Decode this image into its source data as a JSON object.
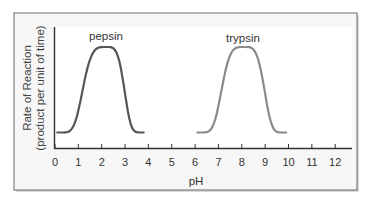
{
  "chart_data": {
    "type": "line",
    "title": "",
    "xlabel": "pH",
    "ylabel": "Rate of Reaction",
    "ylabel_sub": "(product per unit of time)",
    "xlim": [
      0,
      12
    ],
    "x_ticks": [
      "0",
      "1",
      "2",
      "3",
      "4",
      "5",
      "6",
      "7",
      "8",
      "9",
      "10",
      "11",
      "12"
    ],
    "y_ticks": [],
    "grid": false,
    "legend": "none (curves labeled directly)",
    "series": [
      {
        "name": "pepsin",
        "color": "#555555",
        "optimum_pH": 2.2,
        "x": [
          0.1,
          0.6,
          1.0,
          1.5,
          2.0,
          2.2,
          2.5,
          3.0,
          3.4,
          3.8
        ],
        "values": [
          0.12,
          0.3,
          0.62,
          0.95,
          1.0,
          1.0,
          0.98,
          0.72,
          0.3,
          0.1
        ]
      },
      {
        "name": "trypsin",
        "color": "#8a8a8a",
        "optimum_pH": 8.1,
        "x": [
          6.1,
          6.6,
          7.0,
          7.5,
          8.0,
          8.1,
          8.5,
          9.0,
          9.4,
          9.9
        ],
        "values": [
          0.12,
          0.3,
          0.6,
          0.93,
          1.0,
          1.0,
          0.97,
          0.7,
          0.3,
          0.1
        ]
      }
    ]
  },
  "labels": {
    "pepsin": "pepsin",
    "trypsin": "trypsin",
    "xlabel": "pH",
    "ylabel_line1": "Rate of Reaction",
    "ylabel_line2": "(product per unit of time)"
  }
}
